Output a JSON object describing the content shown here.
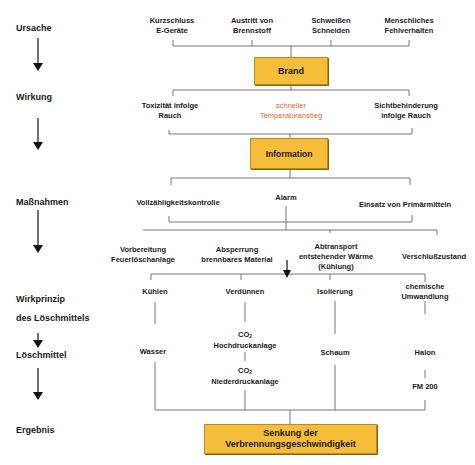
{
  "stages": {
    "ursache": "Ursache",
    "wirkung": "Wirkung",
    "massnahmen": "Maßnahmen",
    "wirkprinzip_1": "Wirkprinzip",
    "wirkprinzip_2": "des Löschmittels",
    "loeschmittel": "Löschmittel",
    "ergebnis": "Ergebnis"
  },
  "causes": [
    {
      "line1": "Kurzschluss",
      "line2": "E-Geräte"
    },
    {
      "line1": "Austritt von",
      "line2": "Brennstoff"
    },
    {
      "line1": "Schweißen",
      "line2": "Schneiden"
    },
    {
      "line1": "Menschliches",
      "line2": "Fehlverhalten"
    }
  ],
  "boxes": {
    "brand": "Brand",
    "information": "Information",
    "result_line1": "Senkung der",
    "result_line2": "Verbrennungsgeschwindigkeit"
  },
  "effects": [
    {
      "line1": "Toxizität infolge",
      "line2": "Rauch",
      "highlight": false
    },
    {
      "line1": "schneller",
      "line2": "Temperaturanstieg",
      "highlight": true,
      "color": "#e4642e"
    },
    {
      "line1": "Sichtbehinderung",
      "line2": "infolge Rauch",
      "highlight": false
    }
  ],
  "measures": [
    "Vollzähligkeitskontrolle",
    "Alarm",
    "Einsatz von Primärmitteln"
  ],
  "sub_measures": [
    {
      "line1": "Vorbereitung",
      "line2": "Feuerlöschanlage"
    },
    {
      "line1": "Absperrung",
      "line2": "brennbares Material"
    },
    {
      "line1": "Abtransport",
      "line2": "entstehender Wärme",
      "line3": "(Kühlung)"
    },
    {
      "line1": "Verschlußzustand"
    }
  ],
  "principles": [
    {
      "line1": "Kühlen"
    },
    {
      "line1": "Verdünnen"
    },
    {
      "line1": "Isolierung"
    },
    {
      "line1": "chemische",
      "line2": "Umwandlung"
    }
  ],
  "agents": {
    "wasser": "Wasser",
    "co2_high_formula": "CO",
    "co2_high_sub": "2",
    "co2_high_label": "Hochdruckanlage",
    "co2_low_formula": "CO",
    "co2_low_sub": "2",
    "co2_low_label": "Niederdruckanlage",
    "schaum": "Schaum",
    "halon": "Halon",
    "fm200": "FM 200"
  },
  "colors": {
    "box_fill": "#f5bd3a",
    "box_border": "#b98a1c",
    "line": "#777777",
    "highlight_text": "#e4642e"
  }
}
